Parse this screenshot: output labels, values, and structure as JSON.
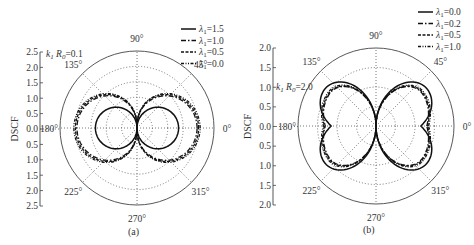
{
  "chart_data": [
    {
      "type": "polar",
      "panel_label": "(a)",
      "ylabel": "DSCF",
      "annotation": "k1 R0=0.1",
      "rlim": [
        0,
        2.5
      ],
      "r_ticks": [
        0.0,
        0.5,
        1.0,
        1.5,
        2.0,
        2.5
      ],
      "r_tick_labels_top": [
        "2.5",
        "2.0",
        "1.5",
        "1.0",
        "0.5",
        "0.0"
      ],
      "r_tick_labels_bottom": [
        "0.5",
        "1.0",
        "1.5",
        "2.0",
        "2.5"
      ],
      "angle_labels": [
        "0°",
        "45°",
        "90°",
        "135°",
        "180°",
        "225°",
        "270°",
        "315°"
      ],
      "grid": true,
      "legend_position": "upper right",
      "series": [
        {
          "name": "λ1=1.5",
          "style": "solid",
          "shape": "figure8",
          "max_r": 1.35,
          "width_factor": 1.0
        },
        {
          "name": "λ1=1.0",
          "style": "dashdot",
          "shape": "figure8",
          "max_r": 1.95,
          "width_factor": 1.35
        },
        {
          "name": "λ1=0.5",
          "style": "dashed",
          "shape": "figure8",
          "max_r": 2.0,
          "width_factor": 1.4
        },
        {
          "name": "λ1=0.0",
          "style": "dashdotdot",
          "shape": "figure8",
          "max_r": 2.05,
          "width_factor": 1.42
        }
      ]
    },
    {
      "type": "polar",
      "panel_label": "(b)",
      "ylabel": "DSCF",
      "annotation": "k1 R0=2.0",
      "rlim": [
        0,
        2.0
      ],
      "r_ticks": [
        0.0,
        0.5,
        1.0,
        1.5,
        2.0
      ],
      "r_tick_labels_top": [
        "2.0",
        "1.5",
        "1.0",
        "0.5",
        "0.0"
      ],
      "r_tick_labels_bottom": [
        "0.5",
        "1.0",
        "1.5",
        "2.0"
      ],
      "angle_labels": [
        "0°",
        "45°",
        "90°",
        "135°",
        "180°",
        "225°",
        "270°",
        "315°"
      ],
      "grid": true,
      "legend_position": "upper right",
      "series": [
        {
          "name": "λ1=0.0",
          "style": "solid",
          "shape": "butterfly",
          "peak_r": 1.62,
          "notch_r": 1.15
        },
        {
          "name": "λ1=0.2",
          "style": "dashdot",
          "shape": "butterfly",
          "peak_r": 1.45,
          "notch_r": 1.3
        },
        {
          "name": "λ1=0.5",
          "style": "dashed",
          "shape": "butterfly",
          "peak_r": 1.47,
          "notch_r": 1.32
        },
        {
          "name": "λ1=1.0",
          "style": "dashdotdot",
          "shape": "butterfly",
          "peak_r": 1.5,
          "notch_r": 1.35
        }
      ]
    }
  ]
}
